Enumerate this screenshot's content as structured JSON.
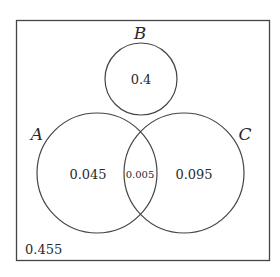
{
  "diagram": {
    "type": "venn",
    "sets": [
      {
        "name": "A",
        "only_value": "0.045"
      },
      {
        "name": "B",
        "only_value": "0.4"
      },
      {
        "name": "C",
        "only_value": "0.095"
      }
    ],
    "labels": {
      "A": "A",
      "B": "B",
      "C": "C"
    },
    "values": {
      "b_only": "0.4",
      "a_only": "0.045",
      "a_and_c": "0.005",
      "c_only": "0.095",
      "outside": "0.455"
    }
  }
}
